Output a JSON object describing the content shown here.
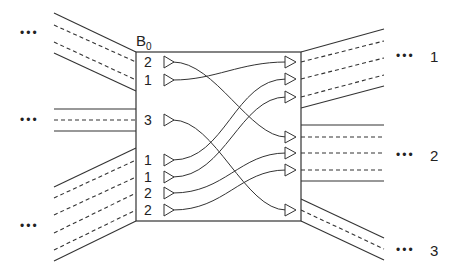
{
  "block": {
    "label": "B",
    "subscript": "0"
  },
  "ellipsis": "•••",
  "left_groups": [
    {
      "id": "top",
      "dots_y": 33
    },
    {
      "id": "middle",
      "dots_y": 120
    },
    {
      "id": "bottom",
      "dots_y": 226
    }
  ],
  "right_groups": [
    {
      "label": "1",
      "y": 56
    },
    {
      "label": "2",
      "y": 155
    },
    {
      "label": "3",
      "y": 250
    }
  ],
  "inputs": [
    {
      "label": "2",
      "y": 62
    },
    {
      "label": "1",
      "y": 80
    },
    {
      "label": "3",
      "y": 120
    },
    {
      "label": "1",
      "y": 160
    },
    {
      "label": "1",
      "y": 177
    },
    {
      "label": "2",
      "y": 193
    },
    {
      "label": "2",
      "y": 210
    }
  ],
  "outputs": [
    {
      "group": "1",
      "y": 62
    },
    {
      "group": "1",
      "y": 79
    },
    {
      "group": "1",
      "y": 97
    },
    {
      "group": "2",
      "y": 137
    },
    {
      "group": "2",
      "y": 153
    },
    {
      "group": "2",
      "y": 170
    },
    {
      "group": "3",
      "y": 210
    }
  ],
  "routes": [
    {
      "from_input": 0,
      "to_output": 3
    },
    {
      "from_input": 1,
      "to_output": 0
    },
    {
      "from_input": 2,
      "to_output": 6
    },
    {
      "from_input": 3,
      "to_output": 1
    },
    {
      "from_input": 4,
      "to_output": 2
    },
    {
      "from_input": 5,
      "to_output": 4
    },
    {
      "from_input": 6,
      "to_output": 5
    }
  ]
}
